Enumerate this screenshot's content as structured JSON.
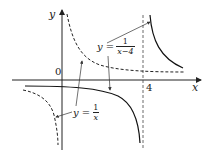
{
  "diagram": {
    "axes": {
      "x_label": "x",
      "y_label": "y",
      "origin_label": "0",
      "asymptote_label": "4"
    },
    "curves": [
      {
        "name": "y = 1/x",
        "style": "dashed",
        "lhs": "y =",
        "numerator": "1",
        "denominator": "x"
      },
      {
        "name": "y = 1/(x-4)",
        "style": "solid",
        "lhs": "y =",
        "numerator": "1",
        "denominator": "x−4"
      }
    ],
    "vertical_asymptote": {
      "x": 4,
      "style": "dashed"
    }
  }
}
